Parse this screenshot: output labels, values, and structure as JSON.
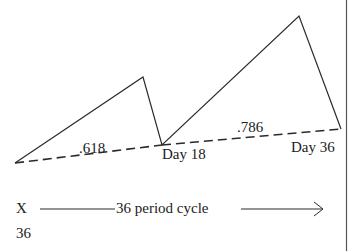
{
  "diagram": {
    "labels": {
      "ratio1": ".618",
      "ratio2": ".786",
      "day18": "Day 18",
      "day36": "Day 36",
      "x": "X",
      "cycle": "36 period cycle",
      "x_value": "36"
    },
    "points": {
      "start": [
        15,
        163
      ],
      "peak1": [
        143,
        77
      ],
      "low_day18": [
        162,
        145
      ],
      "peak2": [
        299,
        16
      ],
      "end_day36": [
        341,
        129
      ]
    },
    "line_color": "#2a2a2a"
  }
}
